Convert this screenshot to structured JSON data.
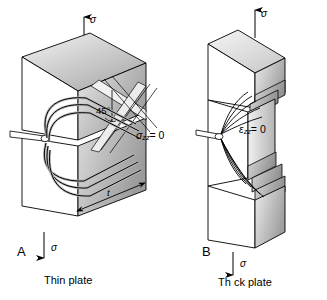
{
  "figure": {
    "background_color": "#ffffff",
    "line_color": "#000000",
    "panels": [
      {
        "letter": "A",
        "caption": "Thin plate",
        "condition_symbol": "σ",
        "condition_subscript": "zz",
        "condition_value": "= 0",
        "angle_label": "45°",
        "thickness_label": "t",
        "load_top": "σ",
        "load_bottom": "σ"
      },
      {
        "letter": "B",
        "caption": "Th ck plate",
        "condition_symbol": "ε",
        "condition_subscript": "zz",
        "condition_value": "= 0",
        "load_top": "σ",
        "load_bottom": "σ"
      }
    ]
  },
  "colors": {
    "outline": "#000000",
    "face_front": "#ffffff",
    "face_top_light": "#f2f2f2",
    "face_top_dark": "#9a9a9a",
    "face_side_light": "#e2e2e2",
    "face_side_dark": "#8c8c8c",
    "plastic_zone_fill": "#bfbfbf",
    "shear_band_fill": "#ededed"
  }
}
